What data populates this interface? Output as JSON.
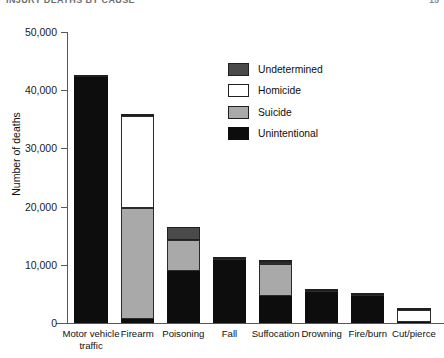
{
  "header": {
    "title": "INJURY DEATHS BY CAUSE",
    "page": "15"
  },
  "chart_data": {
    "type": "bar",
    "stacked": true,
    "title": "",
    "subtitle": "",
    "xlabel": "",
    "ylabel": "Number of deaths",
    "ylim": [
      0,
      50000
    ],
    "yticks": [
      0,
      10000,
      20000,
      30000,
      40000,
      50000
    ],
    "ytick_labels": [
      "0",
      "10,000",
      "20,000",
      "30,000",
      "40,000",
      "50,000"
    ],
    "grid": false,
    "legend_position": "inside-top-right",
    "categories": [
      "Motor vehicle\ntraffic",
      "Firearm",
      "Poisoning",
      "Fall",
      "Suffocation",
      "Drowning",
      "Fire/burn",
      "Cut/pierce"
    ],
    "series": [
      {
        "name": "Unintentional",
        "color": "#0d0d0d",
        "values": [
          42300,
          700,
          9000,
          10900,
          4600,
          5400,
          4600,
          100
        ]
      },
      {
        "name": "Suicide",
        "color": "#a9a9a9",
        "values": [
          0,
          19000,
          5200,
          100,
          5500,
          100,
          100,
          100
        ]
      },
      {
        "name": "Homicide",
        "color": "#ffffff",
        "values": [
          0,
          15900,
          100,
          0,
          300,
          0,
          100,
          2000
        ]
      },
      {
        "name": "Undetermined",
        "color": "#4a4a4a",
        "values": [
          200,
          400,
          2200,
          250,
          200,
          250,
          150,
          100
        ]
      }
    ],
    "totals": [
      42500,
      36000,
      16500,
      11250,
      10600,
      5750,
      4950,
      2300
    ]
  }
}
